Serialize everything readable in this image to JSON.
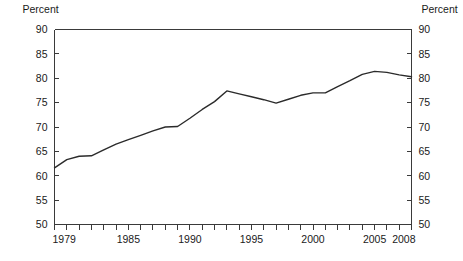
{
  "chart_data": {
    "type": "line",
    "title": "",
    "subtitle": "",
    "xlabel": "",
    "ylabel": "Percent",
    "ylabel_right": "Percent",
    "grid": false,
    "legend": null,
    "legend_position": "none",
    "xlim": [
      1979,
      2008
    ],
    "ylim": [
      50,
      90
    ],
    "y_ticks": [
      50,
      55,
      60,
      65,
      70,
      75,
      80,
      85,
      90
    ],
    "y_tick_labels": [
      "50",
      "55",
      "60",
      "65",
      "70",
      "75",
      "80",
      "85",
      "90"
    ],
    "x_ticks": [
      1979,
      1980,
      1981,
      1982,
      1983,
      1984,
      1985,
      1986,
      1987,
      1988,
      1989,
      1990,
      1991,
      1992,
      1993,
      1994,
      1995,
      1996,
      1997,
      1998,
      1999,
      2000,
      2001,
      2002,
      2003,
      2004,
      2005,
      2006,
      2007,
      2008
    ],
    "x_tick_labels_shown": [
      "1979",
      "1985",
      "1990",
      "1995",
      "2000",
      "2005",
      "2008"
    ],
    "x_labeled_values": [
      1979,
      1985,
      1990,
      1995,
      2000,
      2005,
      2008
    ],
    "x": [
      1979,
      1980,
      1981,
      1982,
      1983,
      1984,
      1985,
      1986,
      1987,
      1988,
      1989,
      1990,
      1991,
      1992,
      1993,
      1994,
      1995,
      1996,
      1997,
      1998,
      1999,
      2000,
      2001,
      2002,
      2003,
      2004,
      2005,
      2006,
      2007,
      2008
    ],
    "values": [
      61.6,
      63.3,
      64.0,
      64.1,
      65.3,
      66.5,
      67.4,
      68.3,
      69.2,
      70.0,
      70.1,
      71.8,
      73.6,
      75.2,
      77.4,
      76.8,
      76.2,
      75.6,
      74.9,
      75.7,
      76.5,
      77.0,
      77.0,
      78.3,
      79.5,
      80.8,
      81.4,
      81.2,
      80.7,
      80.3
    ],
    "line_color": "#2b2b2b",
    "series_name": "Percent"
  },
  "axes": {
    "left_unit": "Percent",
    "right_unit": "Percent"
  }
}
